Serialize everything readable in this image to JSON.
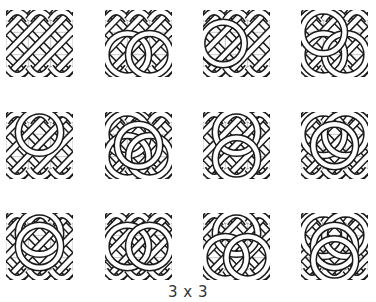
{
  "figure": {
    "caption": "3 x 3",
    "grid_size": 3,
    "tile_size": 67,
    "colors": {
      "strand_outline": "#1a1a1a",
      "strand_fill": "#ffffff",
      "grid_line": "#b8b8b8",
      "background": "#ffffff",
      "caption": "#333333"
    },
    "tiles": [
      {
        "row": 0,
        "col": 0,
        "x": 6,
        "y": 10,
        "loops": []
      },
      {
        "row": 0,
        "col": 1,
        "x": 105,
        "y": 10,
        "loops": [
          "bl",
          "br"
        ]
      },
      {
        "row": 0,
        "col": 2,
        "x": 203,
        "y": 10,
        "loops": [
          "l"
        ]
      },
      {
        "row": 0,
        "col": 3,
        "x": 301,
        "y": 10,
        "loops": [
          "bl",
          "br",
          "tl"
        ]
      },
      {
        "row": 1,
        "col": 0,
        "x": 6,
        "y": 112,
        "loops": [
          "t"
        ]
      },
      {
        "row": 1,
        "col": 1,
        "x": 105,
        "y": 112,
        "loops": [
          "tl",
          "bl",
          "br",
          "mid"
        ]
      },
      {
        "row": 1,
        "col": 2,
        "x": 203,
        "y": 112,
        "loops": [
          "t",
          "b"
        ]
      },
      {
        "row": 1,
        "col": 3,
        "x": 301,
        "y": 112,
        "loops": [
          "tl",
          "tr",
          "mid"
        ]
      },
      {
        "row": 2,
        "col": 0,
        "x": 6,
        "y": 213,
        "loops": [
          "t",
          "m"
        ]
      },
      {
        "row": 2,
        "col": 1,
        "x": 105,
        "y": 213,
        "loops": [
          "vl",
          "vr"
        ]
      },
      {
        "row": 2,
        "col": 2,
        "x": 203,
        "y": 213,
        "loops": [
          "t",
          "bl",
          "br"
        ]
      },
      {
        "row": 2,
        "col": 3,
        "x": 301,
        "y": 213,
        "loops": [
          "tl",
          "tr",
          "mid",
          "b"
        ]
      }
    ]
  }
}
